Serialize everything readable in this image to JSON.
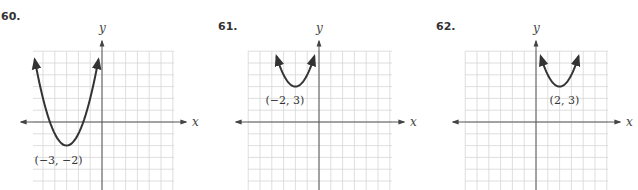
{
  "chart_data": [
    {
      "type": "line",
      "problem_number": "60.",
      "title": "",
      "xlabel": "x",
      "ylabel": "y",
      "xlim": [
        -6,
        6
      ],
      "ylim": [
        -6,
        6
      ],
      "grid": true,
      "function": "y = (x + 3)^2 - 2",
      "vertex": [
        -3,
        -2
      ],
      "vertex_label": "(−3, −2)",
      "curve_x_range": [
        -5.7,
        -0.3
      ]
    },
    {
      "type": "line",
      "problem_number": "61.",
      "title": "",
      "xlabel": "x",
      "ylabel": "y",
      "xlim": [
        -6,
        6
      ],
      "ylim": [
        -6,
        6
      ],
      "grid": true,
      "function": "y = (x + 2)^2 + 3",
      "vertex": [
        -2,
        3
      ],
      "vertex_label": "(−2, 3)",
      "curve_x_range": [
        -3.6,
        -0.4
      ]
    },
    {
      "type": "line",
      "problem_number": "62.",
      "title": "",
      "xlabel": "x",
      "ylabel": "y",
      "xlim": [
        -6,
        6
      ],
      "ylim": [
        -6,
        6
      ],
      "grid": true,
      "function": "y = (x - 2)^2 + 3",
      "vertex": [
        2,
        3
      ],
      "vertex_label": "(2, 3)",
      "curve_x_range": [
        0.4,
        3.6
      ]
    }
  ]
}
